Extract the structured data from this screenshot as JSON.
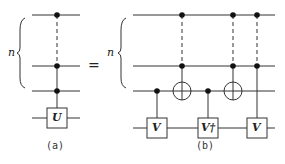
{
  "diagram": {
    "left_circuit": {
      "caption": "(a)",
      "register_label": "n",
      "gate": "U"
    },
    "equals": "=",
    "right_circuit": {
      "caption": "(b)",
      "register_label": "n",
      "gates": [
        "V",
        "V†",
        "V"
      ]
    }
  }
}
